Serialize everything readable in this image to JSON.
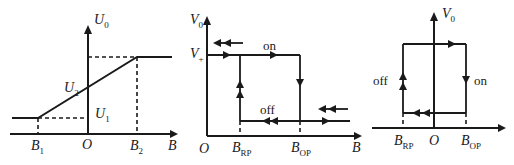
{
  "colors": {
    "ink": "#1a1a1a",
    "background": "#ffffff"
  },
  "top_cut_text": "(a) ......",
  "panel_linear": {
    "y_axis": {
      "name": "U",
      "sub": "0"
    },
    "x_axis": {
      "name": "B"
    },
    "origin": "O",
    "b1": {
      "name": "B",
      "sub": "1"
    },
    "b2": {
      "name": "B",
      "sub": "2"
    },
    "u1": {
      "name": "U",
      "sub": "1"
    },
    "u2": {
      "name": "U",
      "sub": "2"
    }
  },
  "panel_unipolar": {
    "y_axis": {
      "name": "V",
      "sub": "0"
    },
    "x_axis": {
      "name": "B"
    },
    "origin": "O",
    "vplus": {
      "name": "V",
      "sub": "+"
    },
    "brp": {
      "name": "B",
      "sub": "RP"
    },
    "bop": {
      "name": "B",
      "sub": "OP"
    },
    "on_label": "on",
    "off_label": "off"
  },
  "panel_bipolar": {
    "y_axis": {
      "name": "V",
      "sub": "0"
    },
    "x_axis": {
      "name": "B"
    },
    "origin": "O",
    "brp": {
      "name": "B",
      "sub": "RP"
    },
    "bop": {
      "name": "B",
      "sub": "OP"
    },
    "on_label": "on",
    "off_label": "off"
  }
}
